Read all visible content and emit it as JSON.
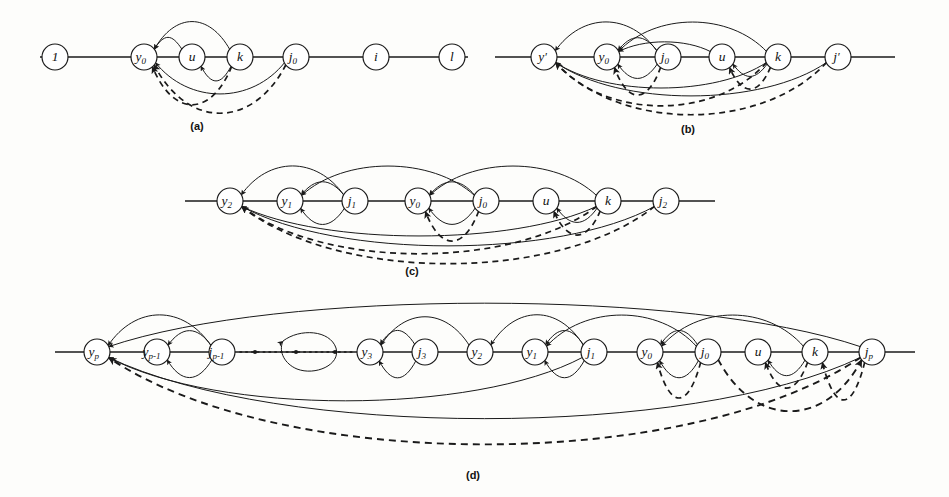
{
  "figure": {
    "type": "diagram",
    "background_color": "#fdfdfb",
    "ink_color": "#1a1a1a",
    "node_radius": 13
  },
  "panels": [
    {
      "id": "a",
      "label": "(a)",
      "label_pos": {
        "x": 197,
        "y": 130
      },
      "baseline_y": 57,
      "baseline": {
        "x1": 40,
        "x2": 468
      },
      "nodes": [
        {
          "name": "1",
          "base": "1",
          "sub": "",
          "x": 55,
          "y": 57
        },
        {
          "name": "y0",
          "base": "y",
          "sub": "0",
          "x": 144,
          "y": 57
        },
        {
          "name": "u",
          "base": "u",
          "sub": "",
          "x": 192,
          "y": 57
        },
        {
          "name": "k",
          "base": "k",
          "sub": "",
          "x": 240,
          "y": 57
        },
        {
          "name": "j0",
          "base": "j",
          "sub": "0",
          "x": 296,
          "y": 57
        },
        {
          "name": "i",
          "base": "i",
          "sub": "",
          "x": 376,
          "y": 57
        },
        {
          "name": "l",
          "base": "l",
          "sub": "",
          "x": 452,
          "y": 57
        }
      ],
      "solid_arcs_above": [
        {
          "from": "k",
          "to": "y0",
          "height": 34
        },
        {
          "from": "u",
          "to": "y0",
          "height": 18
        }
      ],
      "solid_arcs_below": [
        {
          "from": "k",
          "to": "u",
          "depth": 22
        },
        {
          "from": "j0",
          "to": "y0",
          "depth": 36
        }
      ],
      "dashed_arcs_below": [
        {
          "from": "j0",
          "to": "y0",
          "depth": 55
        },
        {
          "from": "k",
          "to": "y0",
          "depth": 46
        }
      ]
    },
    {
      "id": "b",
      "label": "(b)",
      "label_pos": {
        "x": 688,
        "y": 133
      },
      "baseline_y": 57,
      "baseline": {
        "x1": 495,
        "x2": 895
      },
      "nodes": [
        {
          "name": "yprime",
          "base": "y",
          "sub": "",
          "prime": true,
          "x": 544,
          "y": 57
        },
        {
          "name": "y0",
          "base": "y",
          "sub": "0",
          "x": 607,
          "y": 57
        },
        {
          "name": "j0",
          "base": "j",
          "sub": "0",
          "x": 668,
          "y": 57
        },
        {
          "name": "u",
          "base": "u",
          "sub": "",
          "x": 722,
          "y": 57
        },
        {
          "name": "k",
          "base": "k",
          "sub": "",
          "x": 778,
          "y": 57
        },
        {
          "name": "jprime",
          "base": "j",
          "sub": "",
          "prime": true,
          "x": 838,
          "y": 57
        }
      ],
      "solid_arcs_above": [
        {
          "from": "j0",
          "to": "yprime",
          "height": 34
        },
        {
          "from": "k",
          "to": "y0",
          "height": 34
        },
        {
          "from": "j0",
          "to": "y0",
          "height": 18
        },
        {
          "from": "u",
          "to": "y0",
          "height": 14
        }
      ],
      "solid_arcs_below": [
        {
          "from": "j0",
          "to": "y0",
          "depth": 20
        },
        {
          "from": "k",
          "to": "u",
          "depth": 18
        },
        {
          "from": "jprime",
          "to": "yprime",
          "depth": 38
        },
        {
          "from": "k",
          "to": "yprime",
          "depth": 30
        }
      ],
      "dashed_arcs_below": [
        {
          "from": "jprime",
          "to": "yprime",
          "depth": 57
        },
        {
          "from": "k",
          "to": "yprime",
          "depth": 48
        },
        {
          "from": "j0",
          "to": "y0",
          "depth": 36
        },
        {
          "from": "k",
          "to": "u",
          "depth": 30
        }
      ]
    },
    {
      "id": "c",
      "label": "(c)",
      "label_pos": {
        "x": 412,
        "y": 275
      },
      "baseline_y": 201,
      "baseline": {
        "x1": 185,
        "x2": 715
      },
      "nodes": [
        {
          "name": "y2",
          "base": "y",
          "sub": "2",
          "x": 230,
          "y": 201
        },
        {
          "name": "y1",
          "base": "y",
          "sub": "1",
          "x": 290,
          "y": 201
        },
        {
          "name": "j1",
          "base": "j",
          "sub": "1",
          "x": 355,
          "y": 201
        },
        {
          "name": "y0",
          "base": "y",
          "sub": "0",
          "x": 418,
          "y": 201
        },
        {
          "name": "j0",
          "base": "j",
          "sub": "0",
          "x": 486,
          "y": 201
        },
        {
          "name": "u",
          "base": "u",
          "sub": "",
          "x": 546,
          "y": 201
        },
        {
          "name": "k",
          "base": "k",
          "sub": "",
          "x": 608,
          "y": 201
        },
        {
          "name": "j2",
          "base": "j",
          "sub": "2",
          "x": 666,
          "y": 201
        }
      ],
      "solid_arcs_above": [
        {
          "from": "j1",
          "to": "y2",
          "height": 34
        },
        {
          "from": "j0",
          "to": "y1",
          "height": 34
        },
        {
          "from": "k",
          "to": "y0",
          "height": 34
        },
        {
          "from": "j1",
          "to": "y1",
          "height": 18
        },
        {
          "from": "j0",
          "to": "y0",
          "height": 18
        }
      ],
      "solid_arcs_below": [
        {
          "from": "j1",
          "to": "y1",
          "depth": 22
        },
        {
          "from": "j0",
          "to": "y0",
          "depth": 22
        },
        {
          "from": "k",
          "to": "u",
          "depth": 20
        },
        {
          "from": "j2",
          "to": "y2",
          "depth": 44
        },
        {
          "from": "k",
          "to": "y2",
          "depth": 34
        }
      ],
      "dashed_arcs_below": [
        {
          "from": "j2",
          "to": "y2",
          "depth": 62
        },
        {
          "from": "k",
          "to": "y2",
          "depth": 52
        },
        {
          "from": "j0",
          "to": "y0",
          "depth": 38
        },
        {
          "from": "k",
          "to": "u",
          "depth": 32
        }
      ]
    },
    {
      "id": "d",
      "label": "(d)",
      "label_pos": {
        "x": 473,
        "y": 479
      },
      "baseline_y": 352,
      "baseline": {
        "x1": 55,
        "x2": 915
      },
      "dotted_gap": {
        "x1": 240,
        "x2": 352,
        "y": 352,
        "points": [
          {
            "x": 255,
            "y": 352
          },
          {
            "x": 296,
            "y": 352
          },
          {
            "x": 335,
            "y": 352
          }
        ]
      },
      "nodes": [
        {
          "name": "yp",
          "base": "y",
          "sub": "p",
          "x": 97,
          "y": 352
        },
        {
          "name": "yp-1",
          "base": "y",
          "sub": "p-1",
          "x": 157,
          "y": 352
        },
        {
          "name": "jp-1",
          "base": "j",
          "sub": "p-1",
          "x": 222,
          "y": 352
        },
        {
          "name": "y3",
          "base": "y",
          "sub": "3",
          "x": 370,
          "y": 352
        },
        {
          "name": "j3",
          "base": "j",
          "sub": "3",
          "x": 425,
          "y": 352
        },
        {
          "name": "y2",
          "base": "y",
          "sub": "2",
          "x": 480,
          "y": 352
        },
        {
          "name": "y1",
          "base": "y",
          "sub": "1",
          "x": 535,
          "y": 352
        },
        {
          "name": "j1",
          "base": "j",
          "sub": "1",
          "x": 594,
          "y": 352
        },
        {
          "name": "y0",
          "base": "y",
          "sub": "0",
          "x": 650,
          "y": 352
        },
        {
          "name": "j0",
          "base": "j",
          "sub": "0",
          "x": 708,
          "y": 352
        },
        {
          "name": "u",
          "base": "u",
          "sub": "",
          "x": 758,
          "y": 352
        },
        {
          "name": "k",
          "base": "k",
          "sub": "",
          "x": 815,
          "y": 352
        },
        {
          "name": "jp",
          "base": "j",
          "sub": "p",
          "x": 872,
          "y": 352
        }
      ],
      "solid_arcs_above": [
        {
          "from": "jp-1",
          "to": "yp",
          "height": 36
        },
        {
          "from": "jp-1",
          "to": "yp-1",
          "height": 20
        },
        {
          "from": "j3",
          "to": "y3",
          "height": 20
        },
        {
          "from": "y2",
          "to": "y3",
          "height": 34
        },
        {
          "from": "j1",
          "to": "y2",
          "height": 36
        },
        {
          "from": "j1",
          "to": "y1",
          "height": 20
        },
        {
          "from": "j0",
          "to": "y1",
          "height": 36
        },
        {
          "from": "j0",
          "to": "y0",
          "height": 20
        },
        {
          "from": "k",
          "to": "y0",
          "height": 36
        },
        {
          "from": "jp",
          "to": "yp",
          "height": 48
        }
      ],
      "solid_arcs_below": [
        {
          "from": "jp-1",
          "to": "yp-1",
          "depth": 24
        },
        {
          "from": "j3",
          "to": "y3",
          "depth": 24
        },
        {
          "from": "j1",
          "to": "y1",
          "depth": 24
        },
        {
          "from": "j0",
          "to": "y0",
          "depth": 24
        },
        {
          "from": "k",
          "to": "u",
          "depth": 22
        },
        {
          "from": "j1",
          "to": "yp",
          "depth": 48
        },
        {
          "from": "jp",
          "to": "yp",
          "depth": 66
        }
      ],
      "dashed_arcs_below": [
        {
          "from": "jp",
          "to": "yp",
          "depth": 92
        },
        {
          "from": "j0",
          "to": "y0",
          "depth": 44
        },
        {
          "from": "k",
          "to": "u",
          "depth": 34
        },
        {
          "from": "jp",
          "to": "k",
          "depth": 46
        },
        {
          "from": "j0",
          "to": "jp",
          "depth": 58
        }
      ]
    }
  ],
  "panel_labels": [
    "(a)",
    "(b)",
    "(c)",
    "(d)"
  ]
}
